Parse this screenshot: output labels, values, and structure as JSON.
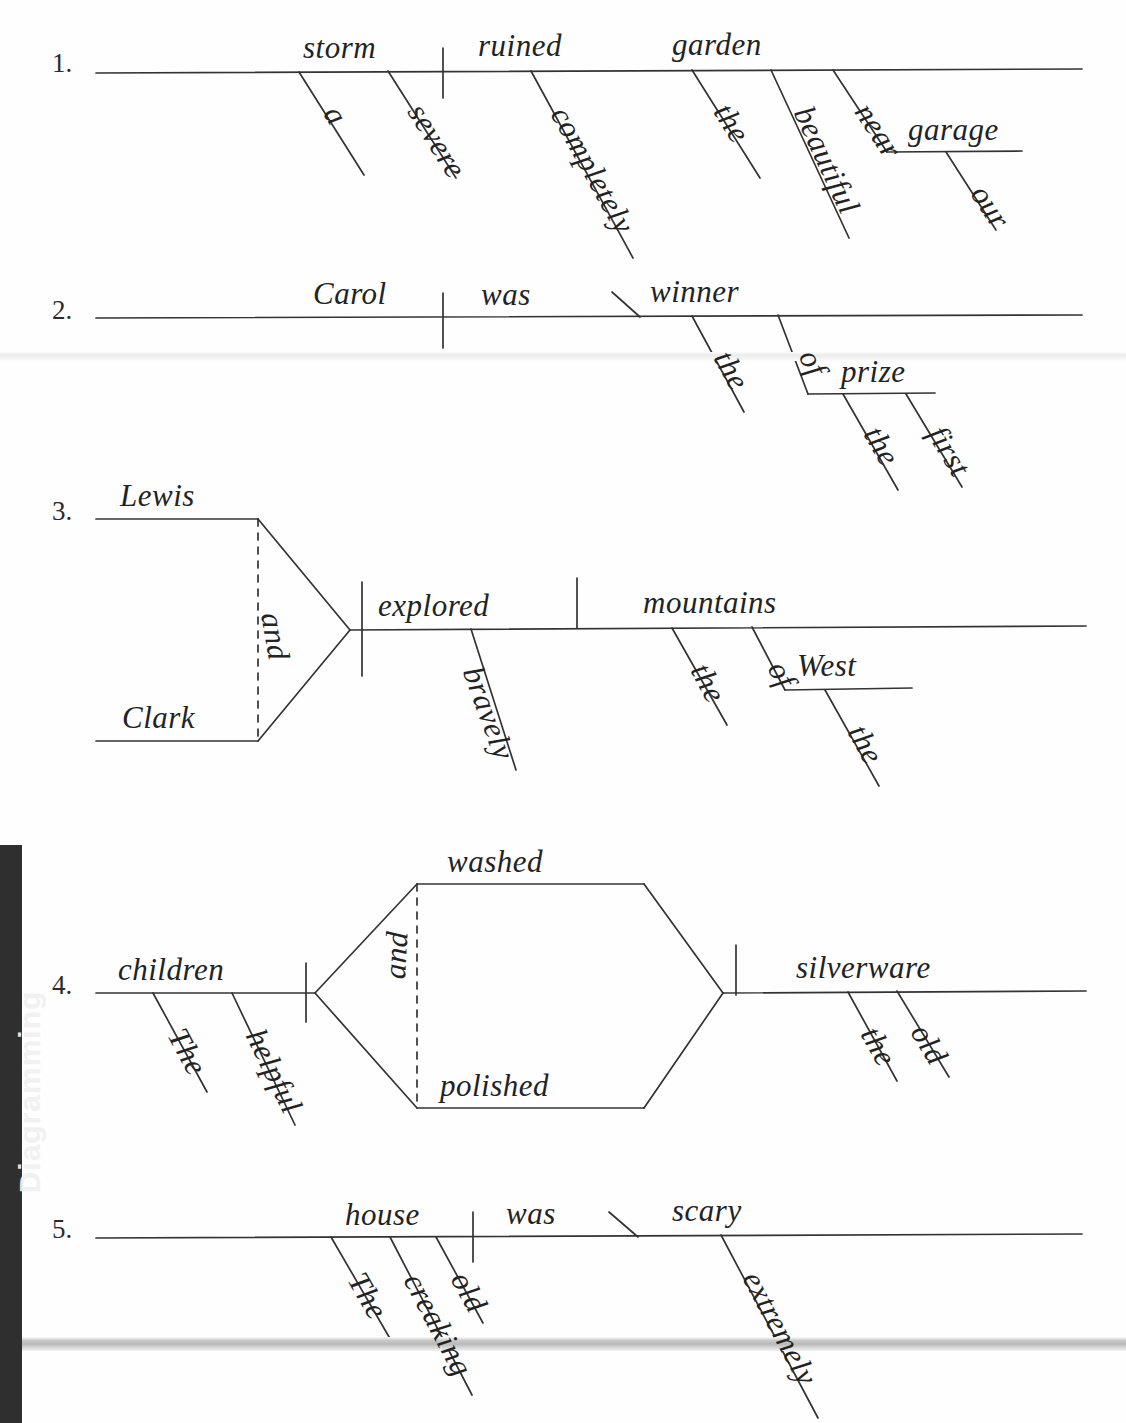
{
  "page": {
    "spine_label": "Diagramming",
    "ink_color": "#232323",
    "paper_color": "#fefefe",
    "spine_color": "#2f2f2f"
  },
  "items": [
    {
      "number": "1.",
      "sentence": "A severe storm completely ruined the beautiful garden near our garage.",
      "structure": "simple",
      "words": {
        "subject": "storm",
        "subject_mod_1": "a",
        "subject_mod_2": "severe",
        "verb": "ruined",
        "verb_mod_1": "completely",
        "object": "garden",
        "object_mod_1": "the",
        "object_mod_2": "beautiful",
        "prep_1": "near",
        "prep_1_object": "garage",
        "prep_1_object_mod": "our"
      }
    },
    {
      "number": "2.",
      "sentence": "Carol was the winner of the first prize.",
      "structure": "predicate-nominative",
      "words": {
        "subject": "Carol",
        "verb": "was",
        "predicate_nominative": "winner",
        "pn_mod_1": "the",
        "prep_1": "of",
        "prep_1_object": "prize",
        "prep_1_object_mod_1": "the",
        "prep_1_object_mod_2": "first"
      }
    },
    {
      "number": "3.",
      "sentence": "Lewis and Clark bravely explored the mountains of the West.",
      "structure": "compound-subject",
      "words": {
        "subject_a": "Lewis",
        "subject_b": "Clark",
        "conjunction": "and",
        "verb": "explored",
        "verb_mod_1": "bravely",
        "object": "mountains",
        "object_mod_1": "the",
        "prep_1": "of",
        "prep_1_object": "West",
        "prep_1_object_mod": "the"
      }
    },
    {
      "number": "4.",
      "sentence": "The helpful children washed and polished the old silverware.",
      "structure": "compound-verb",
      "words": {
        "subject": "children",
        "subject_mod_1": "The",
        "subject_mod_2": "helpful",
        "verb_a": "washed",
        "verb_b": "polished",
        "conjunction": "and",
        "object": "silverware",
        "object_mod_1": "the",
        "object_mod_2": "old"
      }
    },
    {
      "number": "5.",
      "sentence": "The old creaking house was extremely scary.",
      "structure": "predicate-adjective",
      "words": {
        "subject": "house",
        "subject_mod_1": "The",
        "subject_mod_2": "creaking",
        "subject_mod_3": "old",
        "verb": "was",
        "predicate_adjective": "scary",
        "pa_mod_1": "extremely"
      }
    }
  ]
}
